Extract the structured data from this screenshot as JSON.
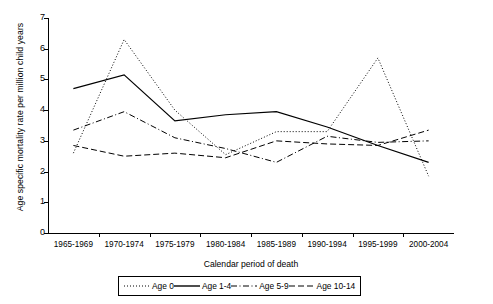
{
  "chart_data": {
    "type": "line",
    "title": "",
    "xlabel": "Calendar period of death",
    "ylabel": "Age specific mortality rate per million child years",
    "categories": [
      "1965-1969",
      "1970-1974",
      "1975-1979",
      "1980-1984",
      "1985-1989",
      "1990-1994",
      "1995-1999",
      "2000-2004"
    ],
    "ylim": [
      0,
      7
    ],
    "yticks": [
      0,
      1,
      2,
      3,
      4,
      5,
      6,
      7
    ],
    "grid": false,
    "legend_position": "bottom",
    "series": [
      {
        "name": "Age 0",
        "style": "dotted",
        "values": [
          2.6,
          6.3,
          4.0,
          2.55,
          3.3,
          3.3,
          5.7,
          1.85
        ]
      },
      {
        "name": "Age 1-4",
        "style": "solid",
        "values": [
          4.7,
          5.15,
          3.65,
          3.85,
          3.95,
          3.45,
          2.85,
          2.3
        ]
      },
      {
        "name": "Age 5-9",
        "style": "dash-dot",
        "values": [
          3.35,
          3.95,
          3.1,
          2.75,
          2.3,
          3.15,
          2.95,
          3.0
        ]
      },
      {
        "name": "Age 10-14",
        "style": "dashed",
        "values": [
          2.85,
          2.5,
          2.6,
          2.45,
          3.0,
          2.9,
          2.85,
          3.35
        ]
      }
    ]
  },
  "legend": {
    "items": [
      {
        "label": "Age 0"
      },
      {
        "label": "Age 1-4"
      },
      {
        "label": "Age 5-9"
      },
      {
        "label": "Age 10-14"
      }
    ]
  }
}
